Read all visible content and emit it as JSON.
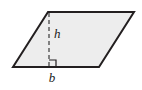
{
  "figure": {
    "kind": "geometry-diagram",
    "shape_name": "parallelogram",
    "background_color": "#ffffff",
    "fill_color": "#ededed",
    "stroke_color": "#231f20",
    "stroke_width": 2,
    "dash_color": "#3a3a3a",
    "canvas": {
      "width": 142,
      "height": 90
    },
    "vertices": {
      "top_left": {
        "x": 48,
        "y": 12
      },
      "top_right": {
        "x": 134,
        "y": 12
      },
      "bottom_right": {
        "x": 99,
        "y": 67
      },
      "bottom_left": {
        "x": 13,
        "y": 67
      }
    },
    "polygon_points": "48,12 134,12 99,67 13,67",
    "height_segment": {
      "label": "h",
      "from": {
        "x": 49,
        "y": 13
      },
      "to": {
        "x": 49,
        "y": 67
      },
      "style": "dashed",
      "dash_pattern": "4,3",
      "label_position": {
        "x": 54,
        "y": 38
      }
    },
    "base_segment": {
      "label": "b",
      "from": {
        "x": 13,
        "y": 67
      },
      "to": {
        "x": 99,
        "y": 67
      },
      "label_position": {
        "x": 52,
        "y": 82
      }
    },
    "right_angle_marker": {
      "name": "right-angle-square",
      "x": 49,
      "y": 60,
      "size": 7,
      "stroke_color": "#231f20"
    }
  }
}
